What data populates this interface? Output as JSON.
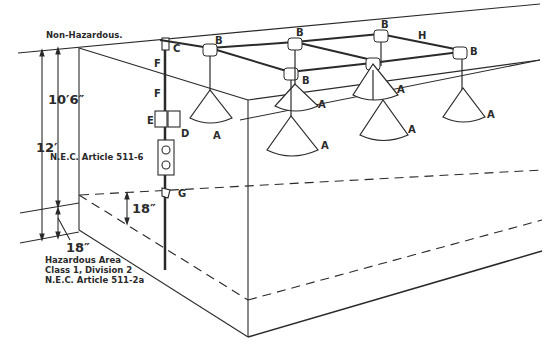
{
  "diagram": {
    "zones": {
      "non_hazardous": "Non-Hazardous.",
      "hazardous": [
        "Hazardous Area",
        "Class 1, Division 2",
        "N.E.C. Article 511-2a"
      ]
    },
    "dimensions": {
      "total_height": "12′",
      "fixture_height": "10′6″",
      "fixture_article": "N.E.C. Article 511-6",
      "hazard_height_front": "18″",
      "hazard_height_side": "18″"
    },
    "component_labels": {
      "fixture": "A",
      "junction_box": "B",
      "c": "C",
      "d": "D",
      "e": "E",
      "f": "F",
      "g": "G",
      "conduit": "H"
    },
    "colors": {
      "line": "#2a2a2a",
      "background": "#ffffff"
    }
  }
}
